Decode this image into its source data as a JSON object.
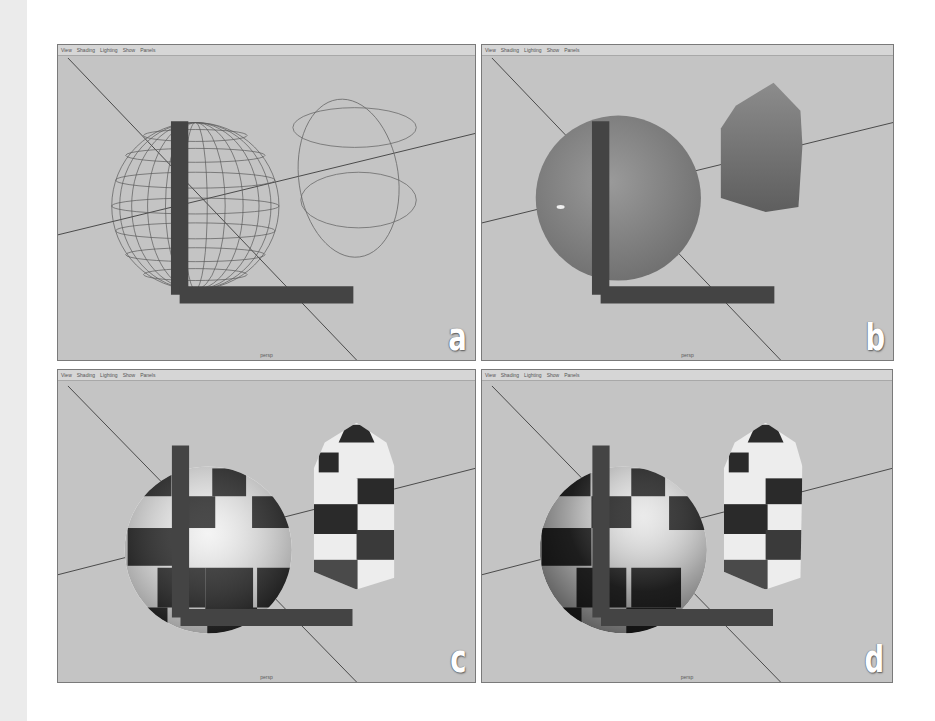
{
  "figure": {
    "panels": [
      {
        "id": "a",
        "letter": "a",
        "mode": "wireframe",
        "menu": [
          "View",
          "Shading",
          "Lighting",
          "Show",
          "Panels"
        ],
        "camera": "persp",
        "objects": [
          "wireframe-sphere",
          "light-manipulator-circles"
        ]
      },
      {
        "id": "b",
        "letter": "b",
        "mode": "smooth-shaded",
        "menu": [
          "View",
          "Shading",
          "Lighting",
          "Show",
          "Panels"
        ],
        "camera": "persp",
        "objects": [
          "shaded-sphere",
          "shaded-capped-prism"
        ]
      },
      {
        "id": "c",
        "letter": "c",
        "mode": "textured-checker",
        "menu": [
          "View",
          "Shading",
          "Lighting",
          "Show",
          "Panels"
        ],
        "camera": "persp",
        "objects": [
          "checker-sphere",
          "checker-capped-prism"
        ]
      },
      {
        "id": "d",
        "letter": "d",
        "mode": "textured-checker-lit",
        "menu": [
          "View",
          "Shading",
          "Lighting",
          "Show",
          "Panels"
        ],
        "camera": "persp",
        "objects": [
          "checker-sphere-shadowed",
          "checker-capped-prism"
        ]
      }
    ],
    "colors": {
      "viewport_bg": "#c4c4c4",
      "grid_line": "#555555",
      "wire": "#5e5e5e",
      "label": "#ffffff"
    }
  }
}
